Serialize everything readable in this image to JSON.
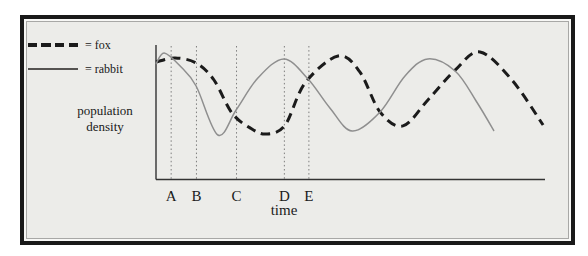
{
  "figure": {
    "bg_color": "#ECECE9",
    "frame_color": "#191919"
  },
  "legend": {
    "items": [
      {
        "label": "= fox",
        "series": "fox",
        "style": "dashed"
      },
      {
        "label": "= rabbit",
        "series": "rabbit",
        "style": "solid"
      }
    ]
  },
  "chart_data": {
    "type": "line",
    "title": "",
    "xlabel": "time",
    "ylabel": "population density",
    "x_range": [
      0,
      100
    ],
    "y_range": [
      0,
      100
    ],
    "grid": false,
    "legend_position": "top-left",
    "axis_color": "#333333",
    "marker_line_color": "#7e7e7e",
    "time_markers": [
      {
        "label": "A",
        "x": 3.9
      },
      {
        "label": "B",
        "x": 10.4
      },
      {
        "label": "C",
        "x": 20.7
      },
      {
        "label": "D",
        "x": 33.0
      },
      {
        "label": "E",
        "x": 39.3
      }
    ],
    "series": [
      {
        "name": "fox",
        "style": "dashed",
        "color": "#1b1b1b",
        "width": 3,
        "points": [
          [
            0,
            87.3
          ],
          [
            4.9,
            90.3
          ],
          [
            10.3,
            86.6
          ],
          [
            14.9,
            73.9
          ],
          [
            19.5,
            49.3
          ],
          [
            24.2,
            38.1
          ],
          [
            28.3,
            33.6
          ],
          [
            33.2,
            40.3
          ],
          [
            38.3,
            71.6
          ],
          [
            46.8,
            91.8
          ],
          [
            52.4,
            79.9
          ],
          [
            57.6,
            50.0
          ],
          [
            63.5,
            39.6
          ],
          [
            69.9,
            59.0
          ],
          [
            76.9,
            81.3
          ],
          [
            83.3,
            94.8
          ],
          [
            91.5,
            73.9
          ],
          [
            99.5,
            40.3
          ]
        ]
      },
      {
        "name": "rabbit",
        "style": "solid",
        "color": "#8f8f8f",
        "width": 1.5,
        "points": [
          [
            0,
            85.8
          ],
          [
            2.1,
            94.0
          ],
          [
            6.2,
            84.3
          ],
          [
            10.3,
            69.4
          ],
          [
            15.9,
            32.8
          ],
          [
            20.6,
            51.5
          ],
          [
            26.2,
            75.4
          ],
          [
            32.9,
            89.6
          ],
          [
            39.1,
            74.6
          ],
          [
            44.7,
            53.0
          ],
          [
            50.4,
            35.8
          ],
          [
            57.6,
            50.0
          ],
          [
            64.0,
            76.9
          ],
          [
            69.9,
            89.6
          ],
          [
            76.9,
            80.6
          ],
          [
            82.3,
            58.2
          ],
          [
            86.9,
            35.8
          ]
        ]
      }
    ]
  }
}
